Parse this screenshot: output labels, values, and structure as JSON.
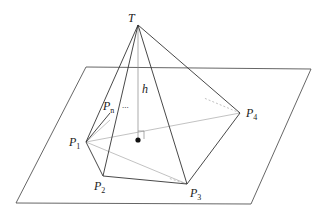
{
  "figure": {
    "labels": {
      "apex": "T",
      "height": "h",
      "p1": {
        "base": "P",
        "sub": "1"
      },
      "p2": {
        "base": "P",
        "sub": "2"
      },
      "p3": {
        "base": "P",
        "sub": "3"
      },
      "p4": {
        "base": "P",
        "sub": "4"
      },
      "pn": {
        "base": "P",
        "sub": "n"
      },
      "ellipsis": "..."
    },
    "colors": {
      "edge": "#333333",
      "hidden": "#999999",
      "plane": "#555555",
      "background": "#ffffff"
    }
  }
}
